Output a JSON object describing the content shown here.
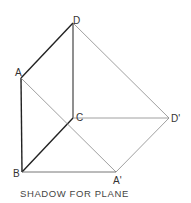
{
  "caption": "SHADOW FOR PLANE",
  "points": {
    "D": {
      "label": "D",
      "x": 73,
      "y": 23
    },
    "A": {
      "label": "A",
      "x": 21,
      "y": 78
    },
    "B": {
      "label": "B",
      "x": 22,
      "y": 172
    },
    "C": {
      "label": "C",
      "x": 73,
      "y": 118
    },
    "D_prime": {
      "label": "D'",
      "x": 169,
      "y": 118
    },
    "A_prime": {
      "label": "A'",
      "x": 116,
      "y": 172
    }
  },
  "colors": {
    "bold_line": "#222222",
    "thin_line": "#777777",
    "background": "#ffffff"
  }
}
